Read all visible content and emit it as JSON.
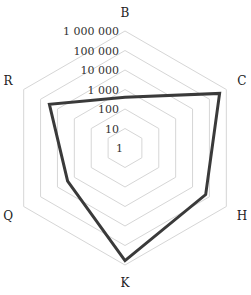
{
  "chart_data": {
    "type": "radar",
    "scale": "log",
    "title": "",
    "axes": [
      "B",
      "C",
      "H",
      "K",
      "Q",
      "R"
    ],
    "tick_labels": [
      "1",
      "10",
      "100",
      "1 000",
      "10 000",
      "100 000",
      "1 000 000"
    ],
    "range": [
      1,
      1000000
    ],
    "grid": true,
    "legend": null,
    "series": [
      {
        "name": "",
        "values": [
          400,
          400000,
          60000,
          600000,
          2500,
          30000
        ],
        "color": "#3a3a3a"
      }
    ]
  }
}
